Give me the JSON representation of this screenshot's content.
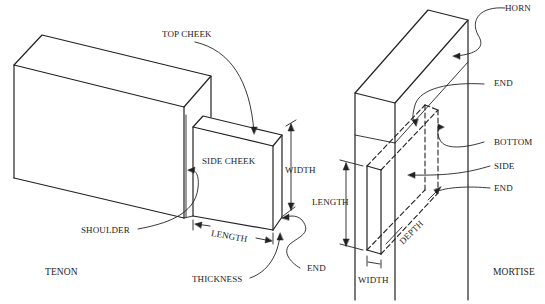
{
  "diagram": {
    "tenon": {
      "caption": "TENON",
      "labels": {
        "top_cheek": "TOP CHEEK",
        "side_cheek": "SIDE CHEEK",
        "width": "WIDTH",
        "shoulder": "SHOULDER",
        "length": "LENGTH",
        "thickness": "THICKNESS",
        "end": "END"
      }
    },
    "mortise": {
      "caption": "MORTISE",
      "labels": {
        "horn": "HORN",
        "end_top": "END",
        "bottom": "BOTTOM",
        "side": "SIDE",
        "end_bottom": "END",
        "length": "LENGTH",
        "depth": "DEPTH",
        "width": "WIDTH"
      }
    },
    "colors": {
      "line": "#222222",
      "background": "#ffffff"
    }
  }
}
